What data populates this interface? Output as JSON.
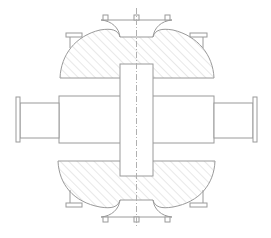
{
  "diagram": {
    "type": "technical-drawing",
    "colors": {
      "background": "#ffffff",
      "line": "#9a9a9a",
      "hatch": "#d4d4d4",
      "centerline": "#b0b0b0"
    },
    "parts": [
      {
        "id": "top-cap",
        "label": "hatched upper dome"
      },
      {
        "id": "bottom-cap",
        "label": "hatched lower dome"
      },
      {
        "id": "central-shaft",
        "label": "central vertical block"
      },
      {
        "id": "body",
        "label": "horizontal body"
      },
      {
        "id": "left-nozzle",
        "label": "left flanged nozzle"
      },
      {
        "id": "right-nozzle",
        "label": "right flanged nozzle"
      },
      {
        "id": "centerline",
        "label": "vertical dash-dot centerline"
      }
    ]
  }
}
